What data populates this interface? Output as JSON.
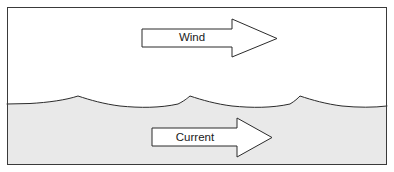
{
  "figure": {
    "type": "schematic-diagram",
    "width": 394,
    "height": 172
  },
  "frame": {
    "name": "figure-border",
    "x": 7,
    "y": 7,
    "width": 380,
    "height": 158,
    "stroke": "#3a3a3a",
    "stroke_width": 1,
    "fill": "#ffffff"
  },
  "sky": {
    "name": "air-region",
    "fill": "#ffffff"
  },
  "water": {
    "name": "water-region",
    "fill": "#e9e9e9",
    "surface_stroke": "#2b2b2b",
    "surface_stroke_width": 1,
    "baseline_y": 104,
    "crest_y": 96,
    "crest_x_positions": [
      78,
      190,
      300
    ],
    "path": "M 7 104 L 30 103.5 C 48 102.5 66 100 78 96 C 90 100 104 104 120 106 C 140 108 160 108 178 104 C 184 101 187 98.5 190 96 C 202 100 216 104 232 106 C 252 108 272 108 290 104 C 295 101 297.5 98.5 300 96 C 312 100 326 104 342 106 C 358 107.6 374 107.6 387 106 L 387 165 L 7 165 Z",
    "surface_line": "M 7 104 L 30 103.5 C 48 102.5 66 100 78 96 C 90 100 104 104 120 106 C 140 108 160 108 178 104 C 184 101 187 98.5 190 96 C 202 100 216 104 232 106 C 252 108 272 108 290 104 C 295 101 297.5 98.5 300 96 C 312 100 326 104 342 106 C 358 107.6 374 107.6 387 106"
  },
  "arrows": [
    {
      "id": "wind",
      "name": "wind-arrow",
      "label": "Wind",
      "label_x": 192,
      "label_y": 38,
      "direction": "right",
      "fill": "#ffffff",
      "stroke": "#2b2b2b",
      "stroke_width": 1,
      "path": "M 142 29 L 232 29 L 232 19 L 277 38.5 L 232 57 L 232 47 L 142 47 Z",
      "region": "air"
    },
    {
      "id": "current",
      "name": "current-arrow",
      "label": "Current",
      "label_x": 195,
      "label_y": 137.5,
      "direction": "right",
      "fill": "#ffffff",
      "stroke": "#2b2b2b",
      "stroke_width": 1,
      "path": "M 152 128 L 237 128 L 237 118 L 272 137.5 L 237 157 L 237 146 L 152 146 Z",
      "region": "water"
    }
  ]
}
